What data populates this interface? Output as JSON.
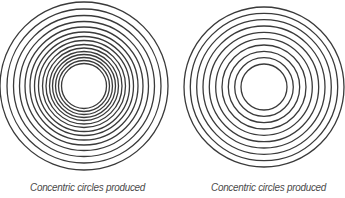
{
  "figures": [
    {
      "id": "left",
      "caption": "Concentric circles produced",
      "center": [
        84,
        86
      ],
      "ring_count": 15,
      "radii": [
        84,
        77,
        70.5,
        64.5,
        59,
        54,
        49.5,
        45.5,
        41.5,
        38,
        34.5,
        31.5,
        28.5,
        25.5,
        22.5
      ],
      "spacing": "decreasing toward center"
    },
    {
      "id": "right",
      "caption": "Concentric circles produced",
      "center": [
        264,
        87
      ],
      "ring_count": 10,
      "radii": [
        80,
        73.7,
        67.3,
        61,
        54.7,
        48.3,
        42,
        35.7,
        29.3,
        23
      ],
      "spacing": "uniform"
    }
  ],
  "colors": {
    "stroke": "#3a3a3a",
    "caption": "#4a4a4a",
    "background": "#ffffff"
  }
}
